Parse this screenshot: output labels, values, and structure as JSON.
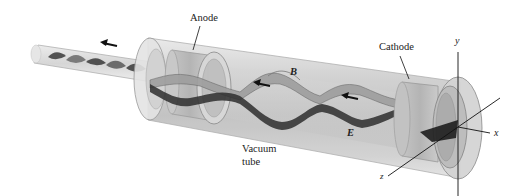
{
  "figure": {
    "labels": {
      "anode": "Anode",
      "cathode": "Cathode",
      "vacuum_tube_line1": "Vacuum",
      "vacuum_tube_line2": "tube",
      "magnetic_field": "B",
      "electric_field": "E"
    },
    "axes": {
      "x": "x",
      "y": "y",
      "z": "z"
    },
    "propagation_direction": "toward -x (leftward arrows)",
    "colors": {
      "tube_glass": "#c8c8c8",
      "wave_dark": "#2a2a2a",
      "wave_light": "#9a9a9a",
      "background": "#ffffff"
    }
  }
}
